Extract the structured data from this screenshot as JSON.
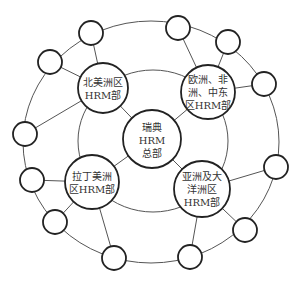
{
  "diagram": {
    "type": "network-rings",
    "colors": {
      "line": "#555555",
      "node_stroke": "#222222",
      "text": "#333333",
      "background": "#ffffff"
    },
    "center": {
      "id": "hq",
      "lines": [
        "瑞典",
        "HRM",
        "总部"
      ],
      "label": "瑞典HRM总部"
    },
    "regions": [
      {
        "id": "north-america",
        "lines": [
          "北美洲区",
          "HRM部"
        ],
        "label": "北美洲区HRM部"
      },
      {
        "id": "emea",
        "lines": [
          "欧洲、非",
          "洲、中东",
          "区HRM部"
        ],
        "label": "欧洲、非洲、中东区HRM部"
      },
      {
        "id": "latin-america",
        "lines": [
          "拉丁美洲",
          "区HRM部"
        ],
        "label": "拉丁美洲区HRM部"
      },
      {
        "id": "asia-pacific",
        "lines": [
          "亚洲及大",
          "洋洲区",
          "HRM部"
        ],
        "label": "亚洲及大洋洲区HRM部"
      }
    ],
    "outer_node_count": 12
  }
}
